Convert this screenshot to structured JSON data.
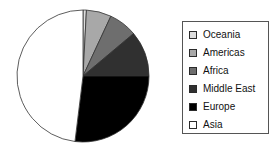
{
  "chart_data": {
    "type": "pie",
    "title": "",
    "subtitle": "",
    "xlabel": "",
    "ylabel": "",
    "grid": false,
    "legend_position": "right",
    "start_angle_deg": 0,
    "direction": "clockwise",
    "center": {
      "x": 83,
      "y": 76
    },
    "radius": 66,
    "categories": [
      "Oceania",
      "Americas",
      "Africa",
      "Middle East",
      "Europe",
      "Asia"
    ],
    "values": [
      0.8,
      6.1,
      6.9,
      11.1,
      27.0,
      48.1
    ],
    "unit": "percent",
    "slices": [
      {
        "label": "Oceania",
        "value": 0.8,
        "angle_deg": 3,
        "start_deg": 0,
        "end_deg": 3,
        "color": "#dcdcdc"
      },
      {
        "label": "Americas",
        "value": 6.1,
        "angle_deg": 22,
        "start_deg": 3,
        "end_deg": 25,
        "color": "#a8a8a8"
      },
      {
        "label": "Africa",
        "value": 6.9,
        "angle_deg": 25,
        "start_deg": 25,
        "end_deg": 50,
        "color": "#6e6e6e"
      },
      {
        "label": "Middle East",
        "value": 11.1,
        "angle_deg": 40,
        "start_deg": 50,
        "end_deg": 90,
        "color": "#303030"
      },
      {
        "label": "Europe",
        "value": 27.0,
        "angle_deg": 97,
        "start_deg": 90,
        "end_deg": 187,
        "color": "#000000"
      },
      {
        "label": "Asia",
        "value": 48.1,
        "angle_deg": 173,
        "start_deg": 187,
        "end_deg": 360,
        "color": "#ffffff"
      }
    ],
    "slice_edge_color": "#333333"
  },
  "legend": {
    "border_color": "#555555",
    "items": [
      {
        "label": "Oceania",
        "color": "#dcdcdc",
        "swatch": "legend-swatch-oceania"
      },
      {
        "label": "Americas",
        "color": "#a8a8a8",
        "swatch": "legend-swatch-americas"
      },
      {
        "label": "Africa",
        "color": "#6e6e6e",
        "swatch": "legend-swatch-africa"
      },
      {
        "label": "Middle East",
        "color": "#303030",
        "swatch": "legend-swatch-middle-east"
      },
      {
        "label": "Europe",
        "color": "#000000",
        "swatch": "legend-swatch-europe"
      },
      {
        "label": "Asia",
        "color": "#ffffff",
        "swatch": "legend-swatch-asia"
      }
    ]
  }
}
